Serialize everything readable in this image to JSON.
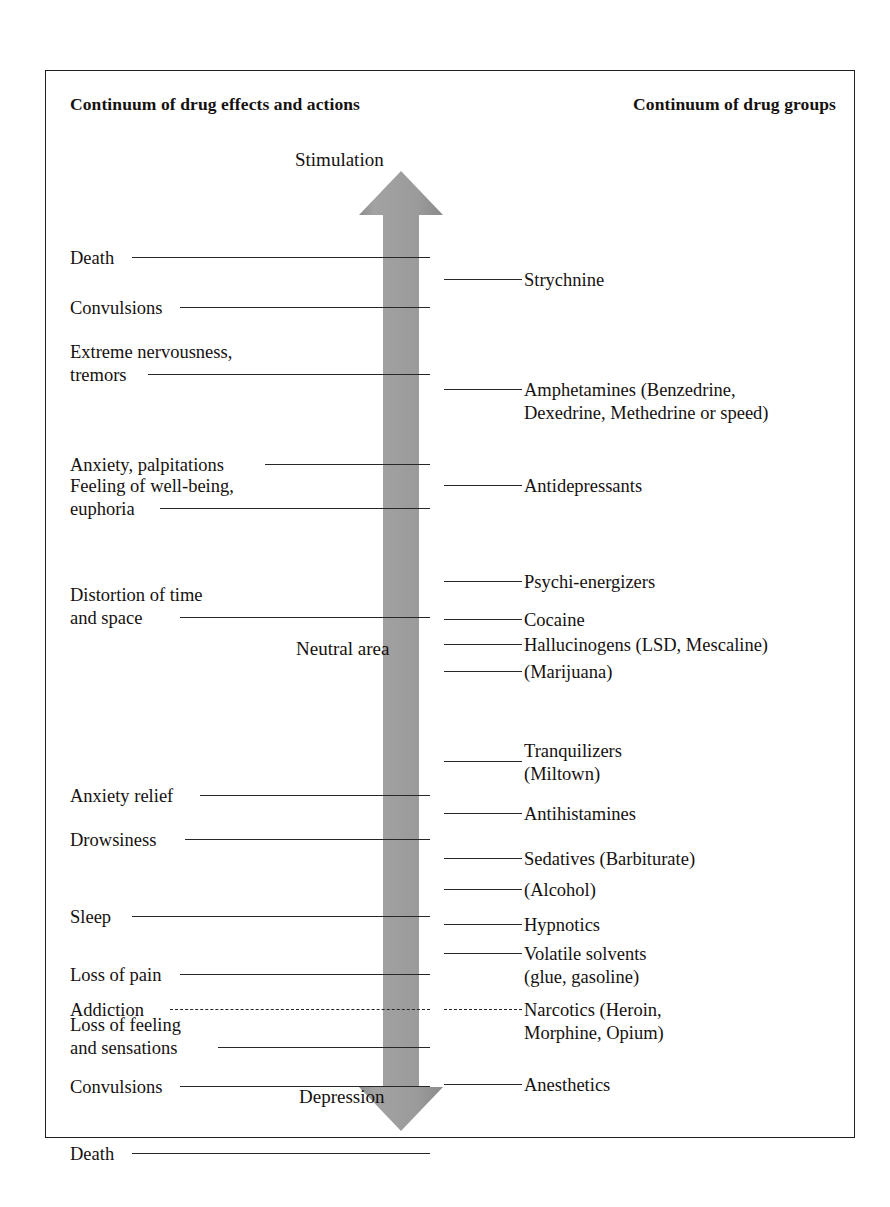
{
  "headers": {
    "left": "Continuum of drug\neffects and actions",
    "right": "Continuum of drug groups"
  },
  "poles": {
    "top": "Stimulation",
    "middle": "Neutral area",
    "bottom": "Depression"
  },
  "colors": {
    "arrow_fill": "#9a9a9a",
    "arrow_fill_dark": "#8d8d8d",
    "line": "#2a2624",
    "frame": "#23201e",
    "text": "#15110f",
    "background": "#ffffff"
  },
  "effects": [
    {
      "label": "Death",
      "y": 176,
      "rule_y": 186,
      "rule_left": 62,
      "style": "solid"
    },
    {
      "label": "Convulsions",
      "y": 226,
      "rule_y": 236,
      "rule_left": 110,
      "style": "solid"
    },
    {
      "label": "Extreme nervousness,\ntremors",
      "y": 270,
      "rule_y": 303,
      "rule_left": 78,
      "style": "solid"
    },
    {
      "label": "Anxiety, palpitations",
      "y": 383,
      "rule_y": 393,
      "rule_left": 195,
      "style": "solid"
    },
    {
      "label": "Feeling of well-being,\neuphoria",
      "y": 404,
      "rule_y": 437,
      "rule_left": 90,
      "style": "solid"
    },
    {
      "label": "Distortion of time\nand space",
      "y": 513,
      "rule_y": 546,
      "rule_left": 110,
      "style": "solid"
    },
    {
      "label": "Anxiety relief",
      "y": 714,
      "rule_y": 724,
      "rule_left": 130,
      "style": "solid"
    },
    {
      "label": "Drowsiness",
      "y": 758,
      "rule_y": 768,
      "rule_left": 115,
      "style": "solid"
    },
    {
      "label": "Sleep",
      "y": 835,
      "rule_y": 845,
      "rule_left": 62,
      "style": "solid"
    },
    {
      "label": "Loss of pain",
      "y": 893,
      "rule_y": 903,
      "rule_left": 110,
      "style": "solid"
    },
    {
      "label": "Addiction",
      "y": 928,
      "rule_y": 938,
      "rule_left": 100,
      "style": "dashed"
    },
    {
      "label": "Loss of feeling\nand sensations",
      "y": 943,
      "rule_y": 976,
      "rule_left": 148,
      "style": "solid"
    },
    {
      "label": "Convulsions",
      "y": 1005,
      "rule_y": 1015,
      "rule_left": 110,
      "style": "solid"
    },
    {
      "label": "Death",
      "y": 1072,
      "rule_y": 1082,
      "rule_left": 62,
      "style": "solid"
    }
  ],
  "groups": [
    {
      "label": "Strychnine",
      "y": 198,
      "rule_y": 208,
      "style": "solid"
    },
    {
      "label": "Amphetamines (Benzedrine,\nDexedrine, Methedrine or speed)",
      "y": 308,
      "rule_y": 318,
      "style": "solid"
    },
    {
      "label": "Antidepressants",
      "y": 404,
      "rule_y": 414,
      "style": "solid"
    },
    {
      "label": "Psychi-energizers",
      "y": 500,
      "rule_y": 510,
      "style": "solid"
    },
    {
      "label": "Cocaine",
      "y": 538,
      "rule_y": 548,
      "style": "solid"
    },
    {
      "label": "Hallucinogens (LSD, Mescaline)",
      "y": 563,
      "rule_y": 573,
      "style": "solid"
    },
    {
      "label": "(Marijuana)",
      "y": 590,
      "rule_y": 600,
      "style": "solid"
    },
    {
      "label": "Tranquilizers\n(Miltown)",
      "y": 669,
      "rule_y": 690,
      "style": "solid"
    },
    {
      "label": "Antihistamines",
      "y": 732,
      "rule_y": 742,
      "style": "solid"
    },
    {
      "label": "Sedatives (Barbiturate)",
      "y": 777,
      "rule_y": 787,
      "style": "solid"
    },
    {
      "label": "(Alcohol)",
      "y": 808,
      "rule_y": 818,
      "style": "solid"
    },
    {
      "label": "Hypnotics",
      "y": 843,
      "rule_y": 853,
      "style": "solid"
    },
    {
      "label": "Volatile solvents\n(glue, gasoline)",
      "y": 872,
      "rule_y": 882,
      "style": "solid"
    },
    {
      "label": "Narcotics (Heroin,\nMorphine, Opium)",
      "y": 928,
      "rule_y": 938,
      "style": "dashed"
    },
    {
      "label": "Anesthetics",
      "y": 1003,
      "rule_y": 1013,
      "style": "solid"
    }
  ]
}
